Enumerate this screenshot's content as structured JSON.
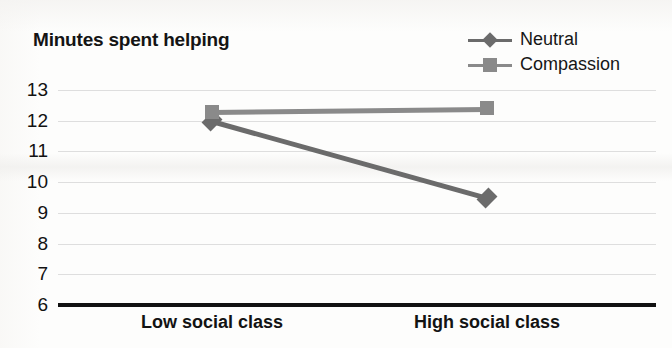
{
  "chart_data": {
    "type": "line",
    "title": "Minutes spent helping",
    "xlabel": "",
    "ylabel": "Minutes spent helping",
    "categories": [
      "Low social class",
      "High social class"
    ],
    "series": [
      {
        "name": "Neutral",
        "marker": "diamond",
        "color": "#6b6b6b",
        "values": [
          12.0,
          9.5
        ]
      },
      {
        "name": "Compassion",
        "marker": "square",
        "color": "#8a8a8a",
        "values": [
          12.3,
          12.4
        ]
      }
    ],
    "ylim": [
      6,
      13
    ],
    "yticks": [
      13,
      12,
      11,
      10,
      9,
      8,
      7,
      6
    ],
    "ytick_labels": [
      "13",
      "12",
      "11",
      "10",
      "9",
      "8",
      "7",
      "6"
    ],
    "grid": true,
    "grid_color": "#d8d8d8",
    "axis_color": "#111111",
    "legend_position": "top-right",
    "legend": [
      "Neutral",
      "Compassion"
    ]
  }
}
